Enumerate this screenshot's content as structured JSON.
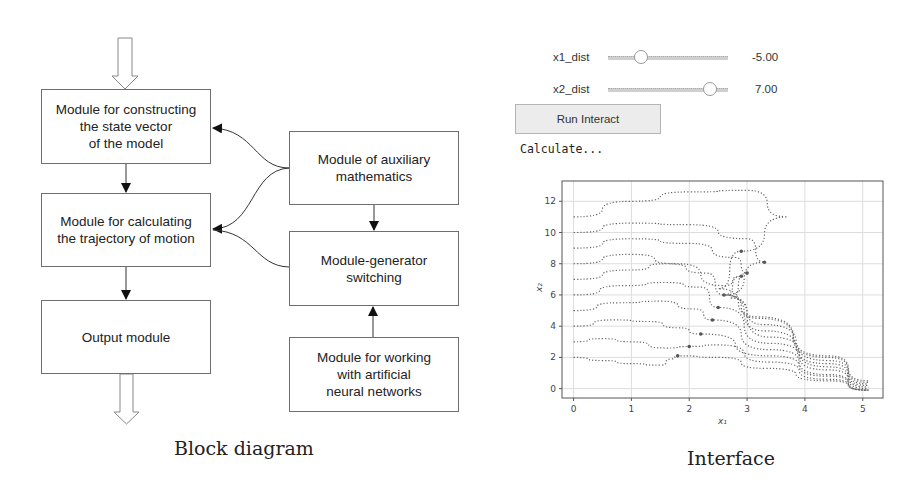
{
  "block_diagram": {
    "caption": "Block diagram",
    "boxes": {
      "state_vector": "Module for constructing\nthe state vector\nof the model",
      "trajectory": "Module for calculating\nthe trajectory of motion",
      "output": "Output module",
      "aux_math": "Module of auxiliary\nmathematics",
      "generator_switching": "Module-generator\nswitching",
      "neural_networks": "Module for working\nwith artificial\nneural networks"
    }
  },
  "interface": {
    "caption": "Interface",
    "sliders": [
      {
        "label": "x1_dist",
        "value": "-5.00"
      },
      {
        "label": "x2_dist",
        "value": "7.00"
      }
    ],
    "run_button": "Run Interact",
    "status": "Calculate..."
  },
  "chart_data": {
    "type": "scatter",
    "title": "",
    "xlabel": "x1",
    "ylabel": "x2",
    "xlim": [
      -0.2,
      5.35
    ],
    "ylim": [
      -0.6,
      13.3
    ],
    "xticks": [
      0,
      1,
      2,
      3,
      4,
      5
    ],
    "yticks": [
      0,
      2,
      4,
      6,
      8,
      10,
      12
    ],
    "grid": true,
    "style": "dotted trajectories",
    "series": [
      {
        "name": "x2_0=2",
        "x": [
          0,
          0.5,
          1,
          1.5,
          1.7,
          1.8,
          2.5,
          3.3,
          4.4,
          5.1
        ],
        "y": [
          2,
          1.8,
          1.6,
          1.5,
          1.9,
          2.1,
          2.0,
          1.3,
          0.5,
          -0.1
        ]
      },
      {
        "name": "x2_0=3",
        "x": [
          0,
          0.5,
          1,
          1.6,
          2.0,
          2.5,
          3.4,
          4.4,
          5.1
        ],
        "y": [
          3,
          3.2,
          3.0,
          2.6,
          2.7,
          2.8,
          1.7,
          0.6,
          -0.1
        ]
      },
      {
        "name": "x2_0=4",
        "x": [
          0,
          0.7,
          1.3,
          1.8,
          2.2,
          3.4,
          4.4,
          5.1
        ],
        "y": [
          4,
          4.4,
          4.3,
          3.9,
          3.5,
          2.1,
          0.8,
          -0.1
        ]
      },
      {
        "name": "x2_0=5",
        "x": [
          0,
          0.8,
          1.5,
          2.1,
          2.4,
          3.4,
          4.4,
          5.1
        ],
        "y": [
          5,
          5.5,
          5.6,
          5.1,
          4.4,
          2.5,
          0.9,
          -0.1
        ]
      },
      {
        "name": "x2_0=6",
        "x": [
          0,
          0.9,
          1.6,
          2.2,
          2.5,
          3.4,
          4.4,
          5.1
        ],
        "y": [
          6,
          6.6,
          6.8,
          6.5,
          5.2,
          2.9,
          1.2,
          0.0
        ]
      },
      {
        "name": "x2_0=7",
        "x": [
          0,
          1,
          1.6,
          2.3,
          2.6,
          3.4,
          4.4,
          5.1
        ],
        "y": [
          7,
          7.6,
          8.0,
          7.4,
          6.0,
          3.3,
          1.4,
          0.1
        ]
      },
      {
        "name": "x2_0=8",
        "x": [
          0,
          1,
          1.8,
          2.6,
          2.9,
          2.6,
          3.3,
          4.4,
          5.1
        ],
        "y": [
          8,
          8.6,
          8.0,
          6.6,
          7.2,
          6.0,
          3.7,
          1.6,
          0.2
        ]
      },
      {
        "name": "x2_0=9",
        "x": [
          0,
          1,
          2,
          2.8,
          3.0,
          2.7,
          3.3,
          4.4,
          5.1
        ],
        "y": [
          9,
          9.6,
          9.3,
          8.4,
          7.4,
          5.8,
          4.1,
          1.8,
          0.3
        ]
      },
      {
        "name": "x2_0=10",
        "x": [
          0,
          1,
          2,
          3.0,
          3.3,
          2.6,
          3.2,
          4.4,
          5.1
        ],
        "y": [
          10,
          10.6,
          10.5,
          9.6,
          8.1,
          6.0,
          4.5,
          2.0,
          0.4
        ]
      },
      {
        "name": "x2_0=11",
        "x": [
          0,
          1,
          2,
          3,
          3.7,
          2.9,
          2.5,
          3.2,
          4.4,
          5.1
        ],
        "y": [
          11,
          12,
          12.6,
          12.7,
          11.0,
          8.8,
          6.4,
          4.6,
          2.1,
          0.5
        ]
      }
    ]
  }
}
